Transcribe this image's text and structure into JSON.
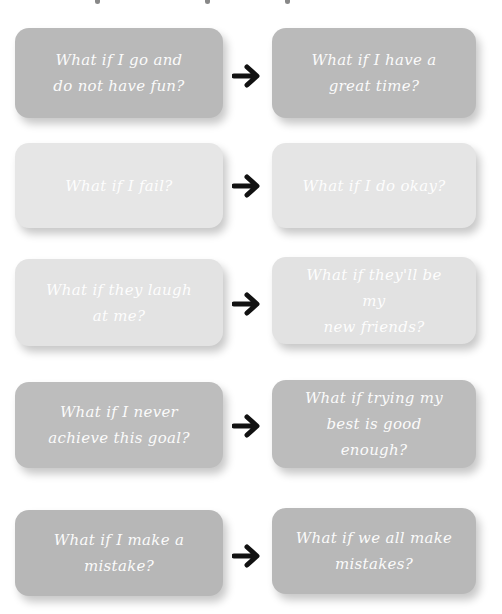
{
  "colors": {
    "row1": "#b9b9b9",
    "row2": "#e6e6e6",
    "row3": "#e3e3e3",
    "row4": "#bdbdbd",
    "row5": "#b7b7b7",
    "text": "#ffffff",
    "arrow": "#111111"
  },
  "rows": [
    {
      "left": "What if I go and\ndo not have fun?",
      "right": "What if I have a\ngreat time?",
      "arrow_icon": "right-arrow-icon"
    },
    {
      "left": "What if I fail?",
      "right": "What if I do okay?",
      "arrow_icon": "right-arrow-icon"
    },
    {
      "left": "What if they laugh\nat me?",
      "right": "What if they'll be my\nnew friends?",
      "arrow_icon": "right-arrow-icon"
    },
    {
      "left": "What if I never\nachieve this goal?",
      "right": "What if trying my\nbest is good enough?",
      "arrow_icon": "right-arrow-icon"
    },
    {
      "left": "What if I make a\nmistake?",
      "right": "What if we all make\nmistakes?",
      "arrow_icon": "right-arrow-icon"
    }
  ]
}
